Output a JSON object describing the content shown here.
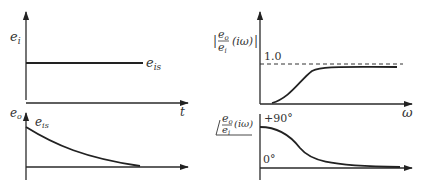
{
  "left_top": {
    "y_label_main": "e",
    "y_label_sub": "i",
    "step_label_main": "e",
    "step_label_sub": "is",
    "x_label": "t"
  },
  "left_bottom": {
    "y_label_main": "e",
    "y_label_sub": "o",
    "curve_label_main": "e",
    "curve_label_sub": "is"
  },
  "right_top": {
    "y_label_num_main": "e",
    "y_label_num_sub": "o",
    "y_label_den_main": "e",
    "y_label_den_sub": "i",
    "y_label_arg": "(iω)",
    "bar": "|",
    "ref_level_label": "1.0",
    "x_label": "ω"
  },
  "right_bottom": {
    "y_label_num_main": "e",
    "y_label_num_sub": "o",
    "y_label_den_main": "e",
    "y_label_den_sub": "i",
    "y_label_arg": "(iω)",
    "upper_label": "+90°",
    "lower_label": "0°"
  }
}
